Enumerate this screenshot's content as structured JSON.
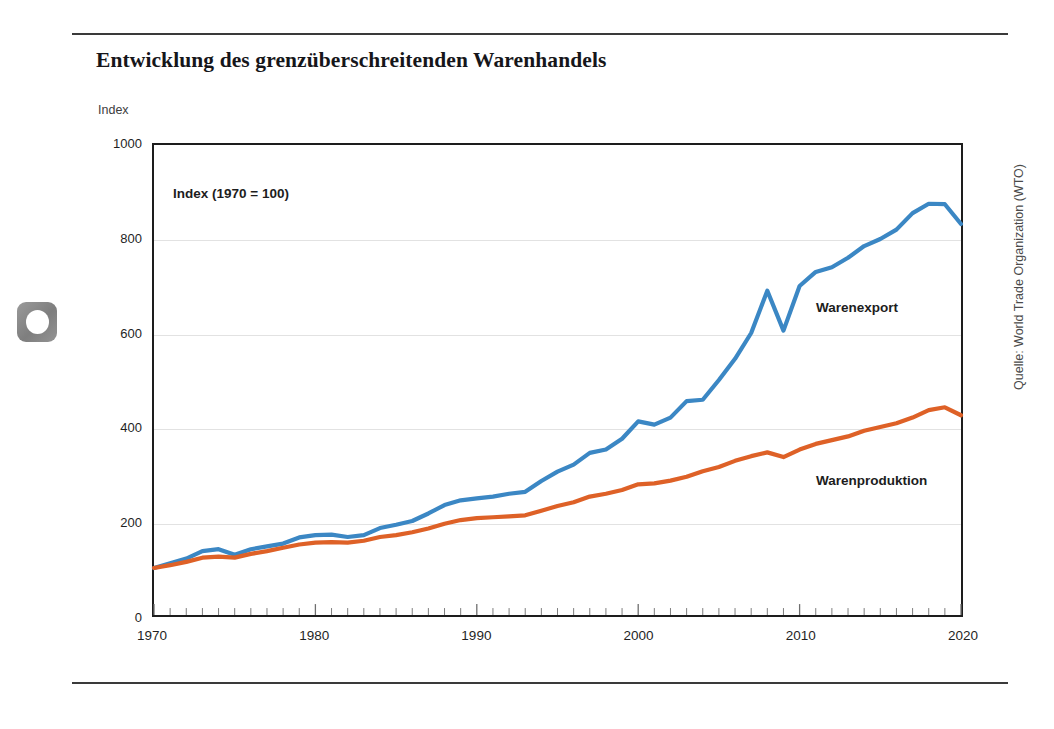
{
  "page": {
    "logo_icon": "rounded-square-dot-icon"
  },
  "header": {
    "title": "Entwicklung des grenzüberschreitenden Warenhandels"
  },
  "axis_unit_caption": "Index",
  "source": "Quelle: World Trade Organization (WTO)",
  "chart_data": {
    "type": "line",
    "title": "Entwicklung des grenzüberschreitenden Warenhandels",
    "subtitle": "",
    "annotation": "Index (1970 = 100)",
    "xlabel": "",
    "ylabel": "Index",
    "xlim": [
      1970,
      2020
    ],
    "ylim": [
      0,
      1000
    ],
    "yticks": [
      0,
      200,
      400,
      600,
      800,
      1000
    ],
    "xticks": [
      1970,
      1980,
      1990,
      2000,
      2010,
      2020
    ],
    "minor_x_tick_step": 1,
    "grid": "horizontal",
    "legend_position": "inline-right",
    "colors": {
      "warenexport": "#3b87c4",
      "warenproduktion": "#de6127",
      "frame": "#1d1d1d",
      "gridline": "#e2e2e2",
      "rule": "#3a3a3a"
    },
    "x": [
      1970,
      1971,
      1972,
      1973,
      1974,
      1975,
      1976,
      1977,
      1978,
      1979,
      1980,
      1981,
      1982,
      1983,
      1984,
      1985,
      1986,
      1987,
      1988,
      1989,
      1990,
      1991,
      1992,
      1993,
      1994,
      1995,
      1996,
      1997,
      1998,
      1999,
      2000,
      2001,
      2002,
      2003,
      2004,
      2005,
      2006,
      2007,
      2008,
      2009,
      2010,
      2011,
      2012,
      2013,
      2014,
      2015,
      2016,
      2017,
      2018,
      2019,
      2020
    ],
    "series": [
      {
        "name": "Warenexport",
        "color": "#3b87c4",
        "values": [
          100,
          110,
          120,
          136,
          140,
          128,
          140,
          146,
          152,
          165,
          170,
          171,
          166,
          170,
          185,
          192,
          200,
          216,
          234,
          244,
          248,
          252,
          258,
          262,
          285,
          305,
          320,
          345,
          352,
          375,
          412,
          405,
          420,
          455,
          458,
          500,
          545,
          600,
          690,
          605,
          700,
          730,
          740,
          760,
          785,
          800,
          820,
          855,
          875,
          874,
          832
        ]
      },
      {
        "name": "Warenproduktion",
        "color": "#de6127",
        "values": [
          100,
          106,
          113,
          122,
          124,
          122,
          130,
          136,
          143,
          150,
          154,
          155,
          154,
          158,
          166,
          170,
          176,
          184,
          194,
          202,
          206,
          208,
          210,
          212,
          222,
          232,
          240,
          252,
          258,
          266,
          278,
          280,
          286,
          294,
          306,
          315,
          328,
          338,
          346,
          336,
          352,
          364,
          372,
          380,
          392,
          400,
          408,
          420,
          436,
          442,
          425
        ]
      }
    ]
  },
  "series_labels": {
    "export": "Warenexport",
    "production": "Warenproduktion"
  }
}
